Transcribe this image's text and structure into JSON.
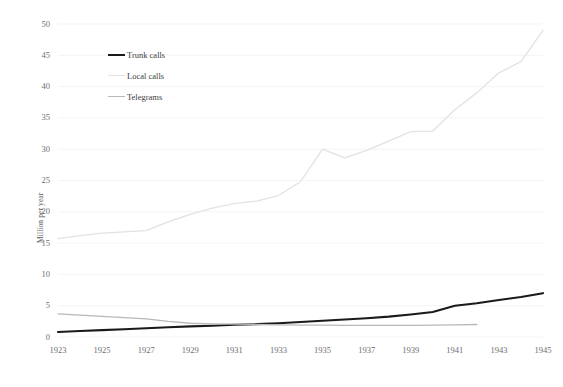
{
  "chart_data": {
    "type": "line",
    "title": "",
    "xlabel": "",
    "ylabel": "Million per year",
    "xlim": [
      1923,
      1945
    ],
    "ylim": [
      0,
      50
    ],
    "grid": true,
    "legend_position": "upper-left-inside",
    "x_tick_labels": [
      "1923",
      "1925",
      "1927",
      "1929",
      "1931",
      "1933",
      "1935",
      "1937",
      "1939",
      "1941",
      "1943",
      "1945"
    ],
    "x_ticks": [
      1923,
      1925,
      1927,
      1929,
      1931,
      1933,
      1935,
      1937,
      1939,
      1941,
      1943,
      1945
    ],
    "y_tick_labels": [
      "0",
      "5",
      "10",
      "15",
      "20",
      "25",
      "30",
      "35",
      "40",
      "45",
      "50"
    ],
    "y_ticks": [
      0,
      5,
      10,
      15,
      20,
      25,
      30,
      35,
      40,
      45,
      50
    ],
    "series": [
      {
        "name": "Trunk calls",
        "color": "#1a1a1a",
        "width": 2.1,
        "x": [
          1923,
          1924,
          1925,
          1926,
          1927,
          1928,
          1929,
          1930,
          1931,
          1932,
          1933,
          1934,
          1935,
          1936,
          1937,
          1938,
          1939,
          1940,
          1941,
          1942,
          1943,
          1944,
          1945
        ],
        "values": [
          0.8,
          0.95,
          1.1,
          1.25,
          1.4,
          1.55,
          1.7,
          1.8,
          1.95,
          2.05,
          2.2,
          2.4,
          2.6,
          2.8,
          3.0,
          3.25,
          3.6,
          4.0,
          5.0,
          5.4,
          5.9,
          6.4,
          7.0
        ]
      },
      {
        "name": "Local calls",
        "color": "#e2e2e4",
        "width": 1.3,
        "x": [
          1923,
          1924,
          1925,
          1926,
          1927,
          1928,
          1929,
          1930,
          1931,
          1932,
          1933,
          1934,
          1935,
          1936,
          1937,
          1938,
          1939,
          1940,
          1941,
          1942,
          1943,
          1944,
          1945
        ],
        "values": [
          15.7,
          16.2,
          16.6,
          16.8,
          17.0,
          18.4,
          19.6,
          20.6,
          21.3,
          21.7,
          22.6,
          24.8,
          30.0,
          28.6,
          29.8,
          31.3,
          32.8,
          32.9,
          36.3,
          39.0,
          42.2,
          44.0,
          49.0
        ]
      },
      {
        "name": "Telegrams",
        "color": "#b8b8ba",
        "width": 1.3,
        "x": [
          1923,
          1924,
          1925,
          1926,
          1927,
          1928,
          1929,
          1930,
          1931,
          1932,
          1933,
          1934,
          1935,
          1936,
          1937,
          1938,
          1939,
          1940,
          1941,
          1942
        ],
        "values": [
          3.7,
          3.5,
          3.3,
          3.1,
          2.9,
          2.5,
          2.2,
          2.1,
          2.05,
          2.0,
          1.95,
          1.9,
          1.9,
          1.85,
          1.85,
          1.85,
          1.85,
          1.9,
          1.95,
          2.0
        ]
      }
    ]
  },
  "legend": {
    "items": [
      {
        "label": "Trunk calls"
      },
      {
        "label": "Local calls"
      },
      {
        "label": "Telegrams"
      }
    ]
  },
  "colors": {
    "grid": "#f4f4f5",
    "tick_text": "#6d6e70",
    "axis_title_text": "#58585a",
    "background": "#ffffff"
  }
}
